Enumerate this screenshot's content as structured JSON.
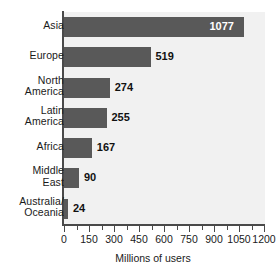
{
  "chart_data": {
    "type": "bar",
    "orientation": "horizontal",
    "title": "",
    "xlabel": "Millions of users",
    "ylabel": "",
    "categories": [
      "Asia",
      "Europe",
      "North America",
      "Latin America",
      "Africa",
      "Middle East",
      "Australia/ Oceania"
    ],
    "category_lines": [
      [
        "Asia"
      ],
      [
        "Europe"
      ],
      [
        "North",
        "America"
      ],
      [
        "Latin",
        "America"
      ],
      [
        "Africa"
      ],
      [
        "Middle",
        "East"
      ],
      [
        "Australia/",
        "Oceania"
      ]
    ],
    "values": [
      1077,
      519,
      274,
      255,
      167,
      90,
      24
    ],
    "value_labels": [
      "1077",
      "519",
      "274",
      "255",
      "167",
      "90",
      "24"
    ],
    "xlim": [
      0,
      1200
    ],
    "xticks": [
      0,
      150,
      300,
      450,
      600,
      750,
      900,
      1050,
      1200
    ],
    "xticklabels": [
      "0",
      "150",
      "300",
      "450",
      "600",
      "750",
      "900",
      "1050",
      "1200"
    ],
    "minor_tick_step": 75,
    "grid": false,
    "legend": null,
    "bar_color": "#595959",
    "plot_background": "#f1f1f1",
    "page_background": "#ffffff",
    "axis_color": "#4a4a4a",
    "label_color": "#1a1a1a",
    "inside_label_color": "#ffffff"
  }
}
